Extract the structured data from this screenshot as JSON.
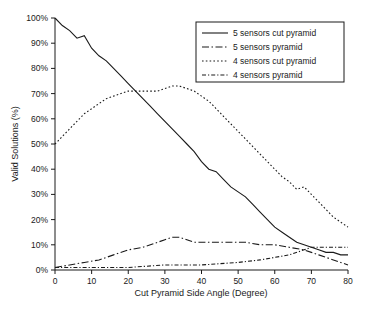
{
  "chart_data": {
    "type": "line",
    "title": "",
    "xlabel": "Cut Pyramid Side Angle (Degree)",
    "ylabel": "Valid Solutions (%)",
    "xlim": [
      0,
      80
    ],
    "ylim": [
      0,
      100
    ],
    "xticks": [
      0,
      10,
      20,
      30,
      40,
      50,
      60,
      70,
      80
    ],
    "xtick_labels": [
      "0",
      "10",
      "20",
      "30",
      "40",
      "50",
      "60",
      "70",
      "80"
    ],
    "yticks": [
      0,
      10,
      20,
      30,
      40,
      50,
      60,
      70,
      80,
      90,
      100
    ],
    "ytick_labels": [
      "0%",
      "10%",
      "20%",
      "30%",
      "40%",
      "50%",
      "60%",
      "70%",
      "80%",
      "90%",
      "100%"
    ],
    "grid": false,
    "legend_position": "top-right",
    "series": [
      {
        "name": "5 sensors cut pyramid",
        "dash": "solid",
        "x": [
          0,
          2,
          4,
          6,
          8,
          10,
          12,
          14,
          16,
          18,
          20,
          22,
          24,
          26,
          28,
          30,
          32,
          34,
          36,
          38,
          40,
          42,
          44,
          46,
          48,
          50,
          52,
          54,
          56,
          58,
          60,
          62,
          64,
          66,
          68,
          70,
          72,
          74,
          76,
          78,
          80
        ],
        "values": [
          100,
          97,
          95,
          92,
          93,
          88,
          85,
          83,
          80,
          77,
          74,
          71,
          68,
          65,
          62,
          59,
          56,
          53,
          50,
          47,
          43,
          40,
          39,
          36,
          33,
          31,
          29,
          26,
          23,
          20,
          17,
          15,
          13,
          11,
          10,
          9,
          8,
          7,
          7,
          6,
          6
        ]
      },
      {
        "name": "5 sensors pyramid",
        "dash": "dashdot-long",
        "x": [
          0,
          4,
          8,
          12,
          16,
          20,
          24,
          28,
          30,
          32,
          34,
          36,
          38,
          40,
          44,
          48,
          52,
          56,
          60,
          64,
          68,
          70,
          72,
          74,
          76,
          78,
          80
        ],
        "values": [
          1,
          2,
          3,
          4,
          6,
          8,
          9,
          11,
          12,
          13,
          13,
          12,
          11,
          11,
          11,
          11,
          11,
          10,
          10,
          9,
          8,
          7,
          6,
          5,
          4,
          3,
          2
        ]
      },
      {
        "name": "4 sensors cut pyramid",
        "dash": "dotted",
        "x": [
          0,
          2,
          4,
          6,
          8,
          10,
          12,
          14,
          16,
          18,
          20,
          22,
          24,
          26,
          28,
          30,
          32,
          34,
          36,
          38,
          40,
          42,
          44,
          46,
          48,
          50,
          52,
          54,
          56,
          58,
          60,
          62,
          64,
          66,
          68,
          70,
          72,
          74,
          76,
          78,
          80
        ],
        "values": [
          50,
          53,
          56,
          59,
          62,
          64,
          66,
          68,
          69,
          70,
          71,
          71,
          71,
          71,
          71,
          72,
          73,
          73,
          72,
          71,
          69,
          67,
          64,
          61,
          58,
          55,
          52,
          49,
          46,
          43,
          40,
          37,
          35,
          32,
          33,
          30,
          27,
          24,
          21,
          19,
          17
        ]
      },
      {
        "name": "4 sensors pyramid",
        "dash": "dashdot-short",
        "x": [
          0,
          10,
          20,
          30,
          40,
          50,
          56,
          60,
          64,
          68,
          70,
          72,
          74,
          76,
          78,
          80
        ],
        "values": [
          1,
          1,
          1,
          2,
          2,
          3,
          4,
          5,
          6,
          8,
          9,
          9,
          9,
          9,
          9,
          9
        ]
      }
    ]
  },
  "legend": {
    "items": [
      {
        "label": "5 sensors cut pyramid"
      },
      {
        "label": "5 sensors pyramid"
      },
      {
        "label": "4 sensors cut pyramid"
      },
      {
        "label": "4 sensors pyramid"
      }
    ]
  }
}
